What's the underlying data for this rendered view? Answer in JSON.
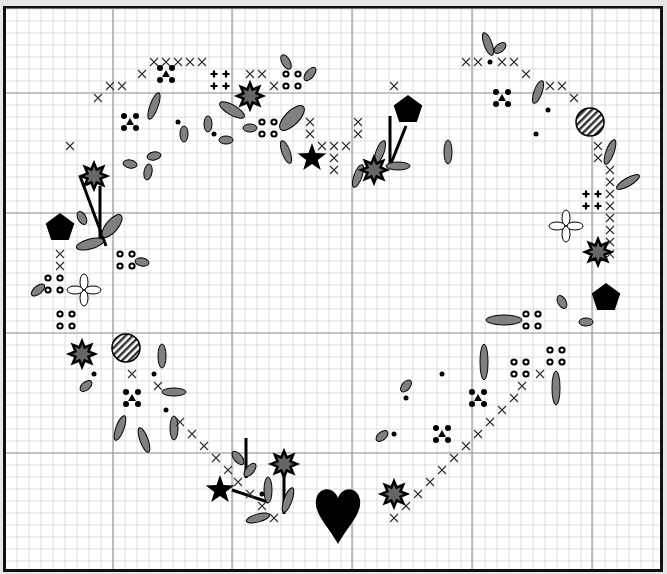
{
  "canvas": {
    "width": 667,
    "height": 574,
    "background": "#e6e6e6"
  },
  "frame": {
    "x": 3,
    "y": 6,
    "w": 660,
    "h": 566,
    "border_color": "#111111"
  },
  "grid": {
    "origin_x": 5,
    "origin_y": 9,
    "cell": 12,
    "major_every": 10,
    "major_x": [
      113,
      232,
      352,
      472,
      592
    ],
    "major_y": [
      93,
      213,
      333,
      453
    ],
    "minor_color": "#dddddd",
    "major_color": "#9a9a9a"
  },
  "colors": {
    "leaf_fill": "#808080",
    "ink": "#000000",
    "star_fill": "#666666"
  },
  "symbols": {
    "cross": [
      [
        98,
        98
      ],
      [
        110,
        86
      ],
      [
        122,
        86
      ],
      [
        142,
        74
      ],
      [
        154,
        62
      ],
      [
        166,
        62
      ],
      [
        178,
        62
      ],
      [
        190,
        62
      ],
      [
        202,
        62
      ],
      [
        70,
        146
      ],
      [
        250,
        74
      ],
      [
        262,
        74
      ],
      [
        274,
        86
      ],
      [
        310,
        122
      ],
      [
        310,
        134
      ],
      [
        322,
        146
      ],
      [
        334,
        146
      ],
      [
        358,
        122
      ],
      [
        358,
        134
      ],
      [
        346,
        146
      ],
      [
        334,
        158
      ],
      [
        334,
        170
      ],
      [
        394,
        86
      ],
      [
        466,
        62
      ],
      [
        478,
        62
      ],
      [
        502,
        62
      ],
      [
        514,
        62
      ],
      [
        526,
        74
      ],
      [
        550,
        86
      ],
      [
        562,
        86
      ],
      [
        574,
        98
      ],
      [
        598,
        146
      ],
      [
        598,
        158
      ],
      [
        610,
        170
      ],
      [
        610,
        182
      ],
      [
        610,
        194
      ],
      [
        610,
        206
      ],
      [
        610,
        218
      ],
      [
        610,
        230
      ],
      [
        610,
        242
      ],
      [
        610,
        254
      ],
      [
        60,
        254
      ],
      [
        60,
        266
      ],
      [
        132,
        374
      ],
      [
        158,
        386
      ],
      [
        180,
        422
      ],
      [
        192,
        434
      ],
      [
        204,
        446
      ],
      [
        216,
        458
      ],
      [
        228,
        470
      ],
      [
        238,
        482
      ],
      [
        250,
        494
      ],
      [
        262,
        506
      ],
      [
        274,
        518
      ],
      [
        540,
        374
      ],
      [
        522,
        386
      ],
      [
        514,
        398
      ],
      [
        502,
        410
      ],
      [
        490,
        422
      ],
      [
        478,
        434
      ],
      [
        466,
        446
      ],
      [
        454,
        458
      ],
      [
        442,
        470
      ],
      [
        430,
        482
      ],
      [
        418,
        494
      ],
      [
        406,
        506
      ],
      [
        394,
        518
      ]
    ],
    "dot_cluster": [
      [
        166,
        74
      ],
      [
        130,
        122
      ],
      [
        502,
        98
      ],
      [
        132,
        398
      ],
      [
        478,
        398
      ],
      [
        442,
        434
      ]
    ],
    "plus_cluster": [
      [
        220,
        80
      ],
      [
        592,
        200
      ]
    ],
    "ring_cluster": [
      [
        292,
        80
      ],
      [
        268,
        128
      ],
      [
        126,
        260
      ],
      [
        54,
        284
      ],
      [
        66,
        320
      ],
      [
        532,
        320
      ],
      [
        520,
        368
      ],
      [
        556,
        356
      ]
    ],
    "dot": [
      [
        490,
        62
      ],
      [
        178,
        122
      ],
      [
        214,
        134
      ],
      [
        548,
        110
      ],
      [
        536,
        134
      ],
      [
        94,
        374
      ],
      [
        154,
        374
      ],
      [
        166,
        410
      ],
      [
        442,
        374
      ],
      [
        406,
        398
      ],
      [
        394,
        434
      ],
      [
        262,
        494
      ]
    ],
    "burst": [
      [
        250,
        96
      ],
      [
        94,
        176
      ],
      [
        374,
        170
      ],
      [
        598,
        252
      ],
      [
        82,
        354
      ],
      [
        284,
        464
      ],
      [
        394,
        494
      ]
    ],
    "pentagon": [
      [
        408,
        110
      ],
      [
        60,
        228
      ],
      [
        606,
        298
      ]
    ],
    "star": [
      [
        312,
        158
      ],
      [
        220,
        490
      ]
    ],
    "striped_circle": [
      [
        590,
        122
      ],
      [
        126,
        348
      ]
    ],
    "flower": [
      [
        566,
        226
      ],
      [
        84,
        290
      ]
    ],
    "heart": [
      [
        338,
        514
      ]
    ],
    "leaves": [
      [
        154,
        106,
        4,
        14,
        20
      ],
      [
        184,
        134,
        4,
        8,
        0
      ],
      [
        208,
        124,
        4,
        8,
        0
      ],
      [
        226,
        140,
        7,
        4,
        0
      ],
      [
        130,
        164,
        7,
        4,
        10
      ],
      [
        154,
        156,
        7,
        4,
        -10
      ],
      [
        148,
        172,
        4,
        8,
        10
      ],
      [
        286,
        62,
        4,
        8,
        -30
      ],
      [
        310,
        74,
        4,
        8,
        40
      ],
      [
        232,
        110,
        14,
        5,
        30
      ],
      [
        292,
        118,
        16,
        7,
        -45
      ],
      [
        250,
        128,
        7,
        4,
        0
      ],
      [
        286,
        152,
        4,
        12,
        -20
      ],
      [
        488,
        44,
        4,
        12,
        -20
      ],
      [
        500,
        48,
        4,
        7,
        50
      ],
      [
        538,
        92,
        4,
        12,
        20
      ],
      [
        448,
        152,
        4,
        12,
        0
      ],
      [
        380,
        152,
        4,
        12,
        20
      ],
      [
        358,
        176,
        4,
        12,
        20
      ],
      [
        398,
        166,
        12,
        4,
        0
      ],
      [
        610,
        152,
        4,
        13,
        20
      ],
      [
        628,
        182,
        4,
        13,
        60
      ],
      [
        82,
        218,
        4,
        7,
        -30
      ],
      [
        112,
        226,
        6,
        14,
        40
      ],
      [
        90,
        244,
        14,
        5,
        -15
      ],
      [
        142,
        262,
        7,
        4,
        10
      ],
      [
        38,
        290,
        4,
        8,
        50
      ],
      [
        562,
        302,
        4,
        7,
        -30
      ],
      [
        504,
        320,
        18,
        5,
        0
      ],
      [
        586,
        322,
        7,
        4,
        0
      ],
      [
        484,
        362,
        4,
        18,
        0
      ],
      [
        556,
        388,
        4,
        17,
        0
      ],
      [
        162,
        356,
        4,
        12,
        0
      ],
      [
        174,
        392,
        12,
        4,
        0
      ],
      [
        86,
        386,
        4,
        7,
        50
      ],
      [
        120,
        428,
        4,
        13,
        20
      ],
      [
        144,
        440,
        4,
        13,
        -20
      ],
      [
        174,
        428,
        4,
        12,
        0
      ],
      [
        406,
        386,
        4,
        7,
        40
      ],
      [
        382,
        436,
        4,
        7,
        50
      ],
      [
        238,
        458,
        4,
        8,
        -40
      ],
      [
        250,
        470,
        4,
        8,
        40
      ],
      [
        268,
        490,
        4,
        13,
        0
      ],
      [
        258,
        518,
        12,
        4,
        -15
      ],
      [
        288,
        500,
        4,
        13,
        20
      ]
    ],
    "stems": [
      [
        80,
        176,
        106,
        246
      ],
      [
        100,
        186,
        100,
        242
      ],
      [
        390,
        116,
        390,
        166
      ],
      [
        406,
        126,
        390,
        166
      ],
      [
        246,
        438,
        246,
        478
      ],
      [
        232,
        490,
        268,
        502
      ],
      [
        284,
        472,
        284,
        514
      ]
    ]
  }
}
